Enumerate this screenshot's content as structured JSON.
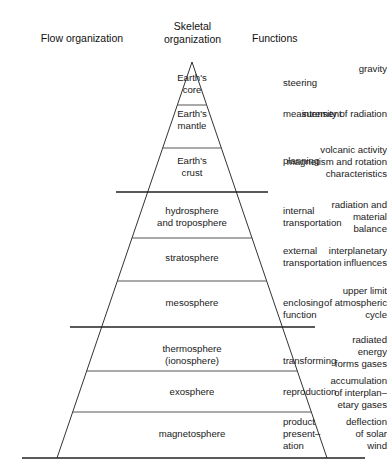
{
  "headers": {
    "flow": "Flow organization",
    "skeletal": "Skeletal\norganization",
    "functions": "Functions"
  },
  "rows": [
    {
      "flow": "gravity",
      "layer": "Earth's\ncore",
      "function": "steering"
    },
    {
      "flow": "intensity of radiation",
      "layer": "Earth's\nmantle",
      "function": "measurement"
    },
    {
      "flow": "volcanic activity\nmagnetism and rotation\ncharacteristics",
      "layer": "Earth's\ncrust",
      "function": "planning"
    },
    {
      "flow": "radiation and\nmaterial\nbalance",
      "layer": "hydrosphere\nand troposphere",
      "function": "internal\ntransportation"
    },
    {
      "flow": "interplanetary\ninfluences",
      "layer": "stratosphere",
      "function": "external\ntransportation"
    },
    {
      "flow": "upper limit\nof atmospheric\ncycle",
      "layer": "mesosphere",
      "function": "enclosing\nfunction"
    },
    {
      "flow": "radiated\nenergy\nforms gases",
      "layer": "thermosphere\n(ionosphere)",
      "function": "transforming"
    },
    {
      "flow": "accumulation\nof interplan–\netary gases",
      "layer": "exosphere",
      "function": "reproduction"
    },
    {
      "flow": "deflection\nof solar\nwind",
      "layer": "magnetosphere",
      "function": "product\npresent–\nation"
    }
  ],
  "colors": {
    "stroke": "#333333",
    "heavy_stroke": "#222222",
    "text": "#1a1a1a",
    "background": "#ffffff"
  }
}
